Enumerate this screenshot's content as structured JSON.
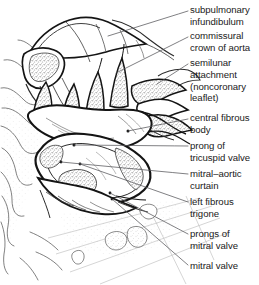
{
  "figure": {
    "kind": "anatomical-line-drawing",
    "style": "pen-and-ink with stipple shading",
    "background_color": "#ffffff",
    "ink_color": "#1a1a1a",
    "leader_line_color": "#55555a",
    "stipple_color": "#8a8a8a",
    "width": 259,
    "height": 285
  },
  "labels": [
    {
      "id": "subpulmonary-infundibulum",
      "lines": [
        "subpulmonary",
        "infundibulum"
      ],
      "text": "subpulmonary infundibulum",
      "x": 190,
      "y": 4,
      "leader": {
        "x1": 188,
        "y1": 11,
        "x2": 108,
        "y2": 36
      }
    },
    {
      "id": "commissural-crown-of-aorta",
      "lines": [
        "commissural",
        "crown of aorta"
      ],
      "text": "commissural crown of aorta",
      "x": 190,
      "y": 30,
      "leader": {
        "x1": 188,
        "y1": 37,
        "x2": 116,
        "y2": 73
      }
    },
    {
      "id": "semilunar-attachment-noncoronary-leaflet",
      "lines": [
        "semilunar",
        "attachment",
        "(noncoronary",
        "leaflet)"
      ],
      "text": "semilunar attachment (noncoronary leaflet)",
      "x": 190,
      "y": 57,
      "leader": {
        "x1": 188,
        "y1": 64,
        "x2": 157,
        "y2": 84
      }
    },
    {
      "id": "central-fibrous-body",
      "lines": [
        "central fibrous",
        "body"
      ],
      "text": "central fibrous body",
      "x": 190,
      "y": 112,
      "leader": {
        "x1": 188,
        "y1": 119,
        "x2": 128,
        "y2": 131
      }
    },
    {
      "id": "prong-of-tricuspid-valve",
      "lines": [
        "prong of",
        "tricuspid valve"
      ],
      "text": "prong of tricuspid valve",
      "x": 190,
      "y": 140,
      "leader": {
        "x1": 188,
        "y1": 146,
        "x2": 74,
        "y2": 145
      }
    },
    {
      "id": "mitral-aortic-curtain",
      "lines": [
        "mitral–aortic",
        "curtain"
      ],
      "text": "mitral–aortic curtain",
      "x": 190,
      "y": 168,
      "leader": {
        "x1": 188,
        "y1": 174,
        "x2": 61,
        "y2": 162
      }
    },
    {
      "id": "left-fibrous-trigone",
      "lines": [
        "left fibrous",
        "trigone"
      ],
      "text": "left fibrous trigone",
      "x": 190,
      "y": 196,
      "leader": {
        "x1": 188,
        "y1": 202,
        "x2": 80,
        "y2": 164
      }
    },
    {
      "id": "prongs-of-mitral-valve",
      "lines": [
        "prongs of",
        "mitral valve"
      ],
      "text": "prongs of mitral valve",
      "x": 190,
      "y": 228,
      "leader": {
        "x1": 188,
        "y1": 234,
        "x2": 110,
        "y2": 193
      }
    },
    {
      "id": "mitral-valve",
      "lines": [
        "mitral valve"
      ],
      "text": "mitral valve",
      "x": 190,
      "y": 260,
      "leader": {
        "x1": 188,
        "y1": 265,
        "x2": 112,
        "y2": 199
      }
    }
  ]
}
